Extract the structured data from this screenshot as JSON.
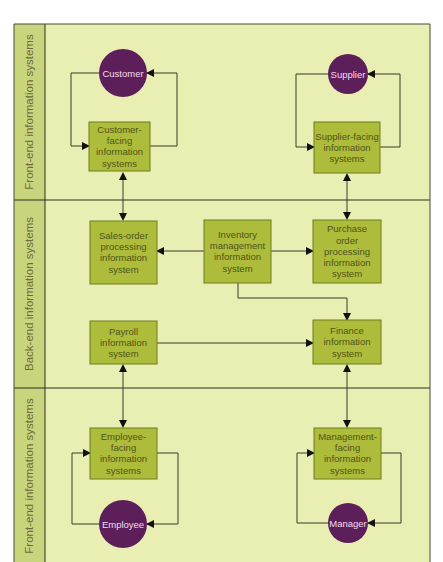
{
  "colors": {
    "lane_background": "#e9eeb2",
    "lane_sidebar": "#c9d57c",
    "system_box": "#adbc3a",
    "actor_circle": "#5c1f5a",
    "actor_text": "#f3dcf3"
  },
  "lanes": [
    {
      "id": "front-top",
      "label": "Front-end information systems"
    },
    {
      "id": "back",
      "label": "Back-end information systems"
    },
    {
      "id": "front-bottom",
      "label": "Front-end information systems"
    }
  ],
  "actors": {
    "customer": "Customer",
    "supplier": "Supplier",
    "employee": "Employee",
    "manager": "Manager"
  },
  "systems": {
    "customer_facing": [
      "Customer-",
      "facing",
      "information",
      "systems"
    ],
    "supplier_facing": [
      "Supplier-facing",
      "information",
      "systems"
    ],
    "sales_order": [
      "Sales-order",
      "processing",
      "information",
      "system"
    ],
    "inventory": [
      "Inventory",
      "management",
      "information",
      "system"
    ],
    "purchase_order": [
      "Purchase",
      "order",
      "processing",
      "information",
      "system"
    ],
    "payroll": [
      "Payroll",
      "information",
      "system"
    ],
    "finance": [
      "Finance",
      "information",
      "system"
    ],
    "employee_facing": [
      "Employee-",
      "facing",
      "information",
      "systems"
    ],
    "management_facing": [
      "Management-",
      "facing",
      "information",
      "systems"
    ]
  },
  "connections": [
    {
      "from": "customer",
      "to": "customer_facing",
      "type": "loop"
    },
    {
      "from": "customer_facing",
      "to": "customer",
      "type": "loop"
    },
    {
      "from": "supplier",
      "to": "supplier_facing",
      "type": "loop"
    },
    {
      "from": "supplier_facing",
      "to": "supplier",
      "type": "loop"
    },
    {
      "from": "customer_facing",
      "to": "sales_order",
      "type": "bidirectional"
    },
    {
      "from": "supplier_facing",
      "to": "purchase_order",
      "type": "bidirectional"
    },
    {
      "from": "inventory",
      "to": "sales_order",
      "type": "directed"
    },
    {
      "from": "inventory",
      "to": "purchase_order",
      "type": "directed"
    },
    {
      "from": "inventory",
      "to": "finance",
      "type": "directed"
    },
    {
      "from": "payroll",
      "to": "finance",
      "type": "directed"
    },
    {
      "from": "payroll",
      "to": "employee_facing",
      "type": "bidirectional"
    },
    {
      "from": "finance",
      "to": "management_facing",
      "type": "bidirectional"
    },
    {
      "from": "employee_facing",
      "to": "employee",
      "type": "loop"
    },
    {
      "from": "employee",
      "to": "employee_facing",
      "type": "loop"
    },
    {
      "from": "management_facing",
      "to": "manager",
      "type": "loop"
    },
    {
      "from": "manager",
      "to": "management_facing",
      "type": "loop"
    }
  ]
}
